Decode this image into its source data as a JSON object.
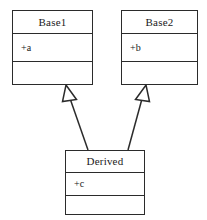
{
  "diagram": {
    "type": "uml-class-diagram",
    "width": 207,
    "height": 220,
    "background_color": "#ffffff",
    "line_color": "#2b2b2b",
    "text_color": "#1a1a1a"
  },
  "classes": [
    {
      "id": "base1",
      "name": "Base1",
      "attributes": [
        "+a"
      ],
      "operations": [],
      "box": {
        "x": 12,
        "y": 10,
        "width": 81,
        "height": 75
      },
      "compartments": {
        "name_h": 22,
        "attrs_h": 28,
        "ops_h": 25
      }
    },
    {
      "id": "base2",
      "name": "Base2",
      "attributes": [
        "+b"
      ],
      "operations": [],
      "box": {
        "x": 121,
        "y": 10,
        "width": 77,
        "height": 75
      },
      "compartments": {
        "name_h": 22,
        "attrs_h": 28,
        "ops_h": 25
      }
    },
    {
      "id": "derived",
      "name": "Derived",
      "attributes": [
        "+c"
      ],
      "operations": [],
      "box": {
        "x": 65,
        "y": 150,
        "width": 80,
        "height": 65
      },
      "compartments": {
        "name_h": 21,
        "attrs_h": 23,
        "ops_h": 21
      }
    }
  ],
  "relationships": [
    {
      "id": "gen-derived-base1",
      "kind": "generalization",
      "label": "",
      "source": "derived",
      "target": "base1",
      "arrowhead": "hollow-triangle",
      "from": {
        "x": 88,
        "y": 150
      },
      "to": {
        "x": 66,
        "y": 85
      }
    },
    {
      "id": "gen-derived-base2",
      "kind": "generalization",
      "label": "",
      "source": "derived",
      "target": "base2",
      "arrowhead": "hollow-triangle",
      "from": {
        "x": 128,
        "y": 150
      },
      "to": {
        "x": 146,
        "y": 85
      }
    }
  ]
}
